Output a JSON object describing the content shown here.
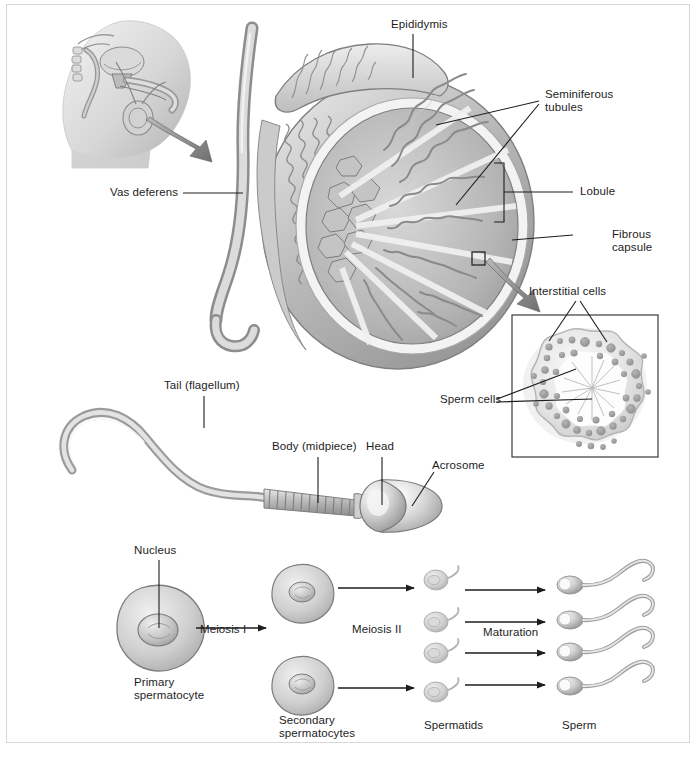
{
  "figure": {
    "type": "anatomical-diagram",
    "color_scheme": "grayscale",
    "background": "#ffffff",
    "frame_color": "#d8d8d8",
    "label_color": "#1d1d1d"
  },
  "panels": {
    "body_inset": {
      "name": "male-pelvis-sagittal-inset",
      "description": "Sagittal view of male pelvis with magnifier arrow pointing to testis cross-section"
    },
    "testis": {
      "name": "testis-cross-section",
      "description": "Cut-away of testis showing epididymis, seminiferous tubules, lobules and fibrous capsule"
    },
    "interstitial_inset": {
      "name": "seminiferous-tubule-inset",
      "description": "Boxed magnification of a seminiferous tubule cross-section"
    },
    "sperm_cell": {
      "name": "mature-sperm-cell",
      "description": "Enlarged single spermatozoon showing tail, midpiece, head and acrosome"
    },
    "spermatogenesis": {
      "name": "spermatogenesis-flow",
      "description": "Flow chart from primary spermatocyte to mature sperm"
    }
  },
  "labels": {
    "epididymis": "Epididymis",
    "seminiferous_tubules": "Seminiferous\ntubules",
    "seminiferous_tubules_line1": "Seminiferous",
    "seminiferous_tubules_line2": "tubules",
    "lobule": "Lobule",
    "fibrous_capsule_line1": "Fibrous",
    "fibrous_capsule_line2": "capsule",
    "vas_deferens": "Vas deferens",
    "interstitial_cells": "Interstitial cells",
    "sperm_cells": "Sperm cells",
    "tail_flagellum": "Tail (flagellum)",
    "body_midpiece": "Body (midpiece)",
    "head": "Head",
    "acrosome": "Acrosome",
    "nucleus": "Nucleus"
  },
  "spermatogenesis": {
    "stages": [
      {
        "id": "primary-spermatocyte",
        "label_line1": "Primary",
        "label_line2": "spermatocyte",
        "count": 1
      },
      {
        "id": "secondary-spermatocytes",
        "label_line1": "Secondary",
        "label_line2": "spermatocytes",
        "count": 2
      },
      {
        "id": "spermatids",
        "label_line1": "Spermatids",
        "label_line2": "",
        "count": 4
      },
      {
        "id": "sperm",
        "label_line1": "Sperm",
        "label_line2": "",
        "count": 4
      }
    ],
    "transitions": [
      {
        "id": "meiosis-1",
        "label": "Meiosis I"
      },
      {
        "id": "meiosis-2",
        "label": "Meiosis II"
      },
      {
        "id": "maturation",
        "label": "Maturation"
      }
    ]
  }
}
